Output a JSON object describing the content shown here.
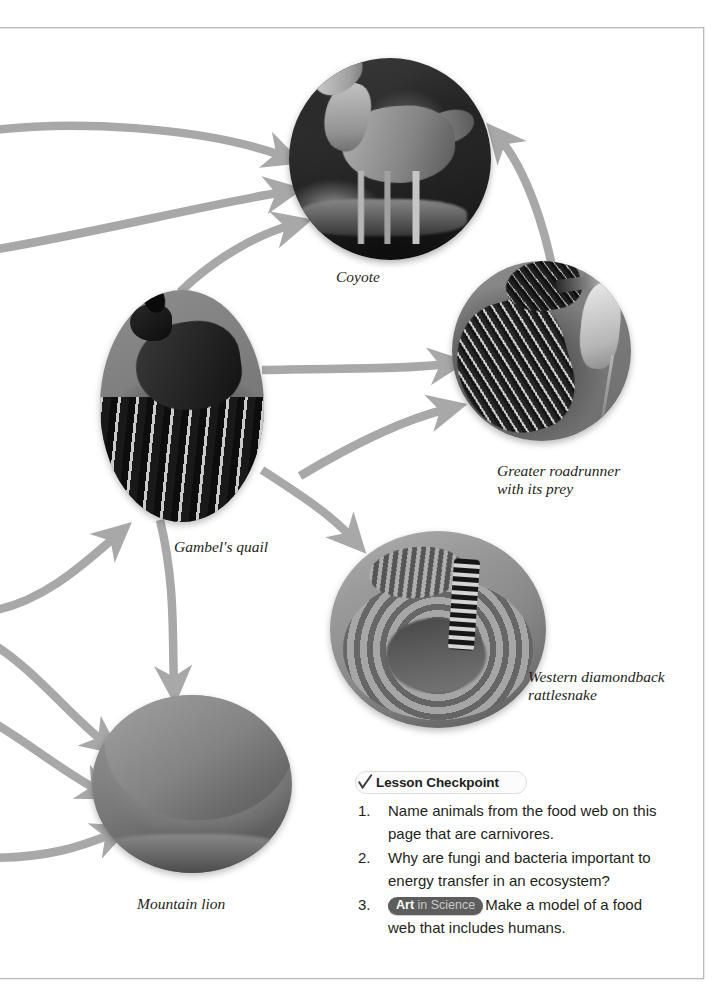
{
  "page": {
    "type": "textbook-page",
    "topic": "Desert food web — carnivores",
    "background_color": "#ffffff",
    "border_color": "#b9b9b9"
  },
  "diagram": {
    "arrow_color": "#a8a8a8",
    "nodes": [
      {
        "id": "coyote",
        "caption": "Coyote",
        "photo": "coyote-photo",
        "shape": "circle"
      },
      {
        "id": "roadrunner",
        "caption": "Greater roadrunner\nwith its prey",
        "photo": "roadrunner-photo",
        "shape": "circle"
      },
      {
        "id": "quail",
        "caption": "Gambel's quail",
        "photo": "quail-photo",
        "shape": "circle"
      },
      {
        "id": "rattlesnake",
        "caption": "Western diamondback\nrattlesnake",
        "photo": "rattlesnake-photo",
        "shape": "circle"
      },
      {
        "id": "lion",
        "caption": "Mountain lion",
        "photo": "mountain-lion-photo",
        "shape": "circle"
      }
    ],
    "edges": [
      {
        "from": "off-page-left",
        "to": "coyote"
      },
      {
        "from": "off-page-left",
        "to": "coyote"
      },
      {
        "from": "quail",
        "to": "coyote"
      },
      {
        "from": "rattlesnake",
        "to": "coyote"
      },
      {
        "from": "quail",
        "to": "roadrunner"
      },
      {
        "from": "rattlesnake",
        "to": "roadrunner"
      },
      {
        "from": "off-page-left",
        "to": "quail"
      },
      {
        "from": "quail",
        "to": "rattlesnake"
      },
      {
        "from": "quail",
        "to": "lion"
      },
      {
        "from": "off-page-left",
        "to": "lion"
      },
      {
        "from": "off-page-left",
        "to": "lion"
      },
      {
        "from": "off-page-left",
        "to": "lion"
      }
    ]
  },
  "checkpoint": {
    "title": "Lesson Checkpoint",
    "check_icon": "check-mark-icon",
    "items": [
      {
        "number": "1.",
        "text": "Name animals from the food web on this page that are carnivores."
      },
      {
        "number": "2.",
        "text": "Why are fungi and bacteria important to energy transfer in an ecosystem?"
      },
      {
        "number": "3.",
        "badge": {
          "bold": "Art",
          "rest": "in Science"
        },
        "text": "Make a model of a food web that includes humans."
      }
    ]
  }
}
